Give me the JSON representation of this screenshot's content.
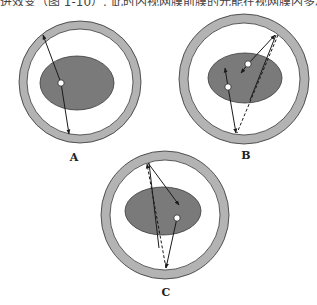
{
  "caption_fragment": "进效变（图 1-10）. 此时内视网膜前膜的光能在视网膜内多次反复",
  "colors": {
    "ring": "#b3b3b3",
    "ring_stroke": "#333333",
    "ellipse": "#7a7a7a",
    "ellipse_stroke": "#3a3a3a",
    "line": "#1a1a1a",
    "dot": "#ffffff"
  },
  "panels": [
    {
      "id": "A",
      "label": "A"
    },
    {
      "id": "B",
      "label": "B"
    },
    {
      "id": "C",
      "label": "C"
    }
  ]
}
